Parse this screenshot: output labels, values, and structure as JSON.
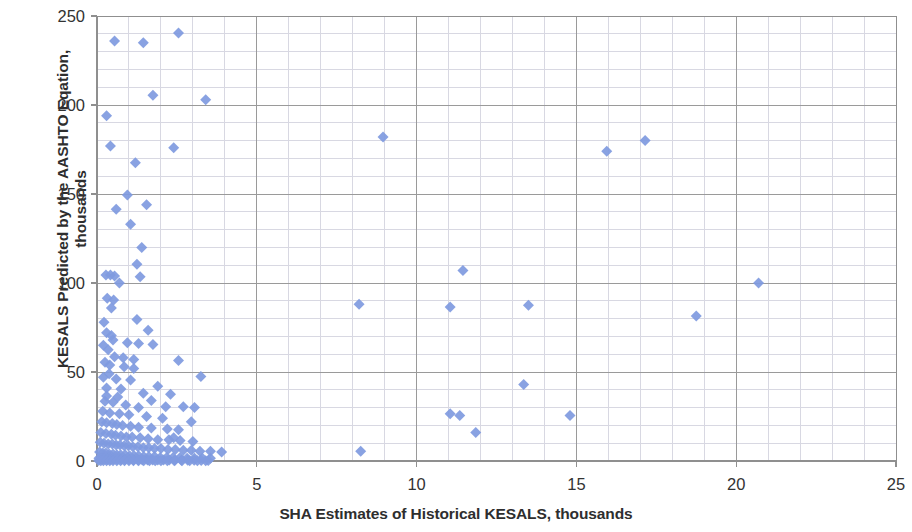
{
  "chart_data": {
    "type": "scatter",
    "title": "",
    "xlabel": "SHA Estimates of Historical KESALS, thousands",
    "ylabel": "KESALS Predicted by the AASHTO Eqation, thousands",
    "ylabel_line1": "KESALS Predicted by the AASHTO Eqation,",
    "ylabel_line2": "thousands",
    "xlim": [
      0,
      25
    ],
    "ylim": [
      0,
      250
    ],
    "xticks": [
      0,
      5,
      10,
      15,
      20,
      25
    ],
    "yticks": [
      0,
      50,
      100,
      150,
      200,
      250
    ],
    "xtick_labels": [
      "0",
      "5",
      "10",
      "15",
      "20",
      "25"
    ],
    "ytick_labels": [
      "0",
      "50",
      "100",
      "150",
      "200",
      "250"
    ],
    "x_minor_step": 1,
    "y_minor_step": 10,
    "grid": true,
    "grid_major_color": "#9a9a9a",
    "grid_minor_color": "#d8d8e2",
    "legend": false,
    "legend_position": "none",
    "series": [
      {
        "name": "KESALS",
        "marker": "diamond",
        "marker_color": "#7f9adf",
        "marker_size": 11,
        "points": [
          [
            0.3,
            194.0
          ],
          [
            0.55,
            236.0
          ],
          [
            1.45,
            235.0
          ],
          [
            2.55,
            240.5
          ],
          [
            0.42,
            177.0
          ],
          [
            1.2,
            167.5
          ],
          [
            1.75,
            205.5
          ],
          [
            2.4,
            176.0
          ],
          [
            3.4,
            203.0
          ],
          [
            8.95,
            182.0
          ],
          [
            15.95,
            174.0
          ],
          [
            17.15,
            180.0
          ],
          [
            0.6,
            141.5
          ],
          [
            0.95,
            149.5
          ],
          [
            1.05,
            133.0
          ],
          [
            1.55,
            144.0
          ],
          [
            1.25,
            110.5
          ],
          [
            11.45,
            107.0
          ],
          [
            0.28,
            104.5
          ],
          [
            0.42,
            104.5
          ],
          [
            0.55,
            104.0
          ],
          [
            1.35,
            103.5
          ],
          [
            20.7,
            100.0
          ],
          [
            0.32,
            91.5
          ],
          [
            0.52,
            90.5
          ],
          [
            8.2,
            88.0
          ],
          [
            11.05,
            86.5
          ],
          [
            13.5,
            87.5
          ],
          [
            18.75,
            81.5
          ],
          [
            0.22,
            78.0
          ],
          [
            0.3,
            72.0
          ],
          [
            0.45,
            70.5
          ],
          [
            1.25,
            79.5
          ],
          [
            1.6,
            73.5
          ],
          [
            0.2,
            65.0
          ],
          [
            0.35,
            62.5
          ],
          [
            0.95,
            66.5
          ],
          [
            1.3,
            66.0
          ],
          [
            1.75,
            65.5
          ],
          [
            0.55,
            58.5
          ],
          [
            0.25,
            55.5
          ],
          [
            0.4,
            54.0
          ],
          [
            0.85,
            53.0
          ],
          [
            1.15,
            52.0
          ],
          [
            2.55,
            56.5
          ],
          [
            13.35,
            43.0
          ],
          [
            0.2,
            47.0
          ],
          [
            0.6,
            46.0
          ],
          [
            1.05,
            45.5
          ],
          [
            3.25,
            47.5
          ],
          [
            0.3,
            41.0
          ],
          [
            0.75,
            40.5
          ],
          [
            1.45,
            38.0
          ],
          [
            2.3,
            37.5
          ],
          [
            0.25,
            33.5
          ],
          [
            0.5,
            33.0
          ],
          [
            0.9,
            31.5
          ],
          [
            1.3,
            30.0
          ],
          [
            2.7,
            30.5
          ],
          [
            3.05,
            30.0
          ],
          [
            11.05,
            26.5
          ],
          [
            11.35,
            25.5
          ],
          [
            14.8,
            25.5
          ],
          [
            0.18,
            28.0
          ],
          [
            0.4,
            27.0
          ],
          [
            0.7,
            26.5
          ],
          [
            1.0,
            26.0
          ],
          [
            1.55,
            25.0
          ],
          [
            2.05,
            24.0
          ],
          [
            11.85,
            16.0
          ],
          [
            0.15,
            22.0
          ],
          [
            0.3,
            21.5
          ],
          [
            0.48,
            21.0
          ],
          [
            0.62,
            20.5
          ],
          [
            0.8,
            20.0
          ],
          [
            1.05,
            19.5
          ],
          [
            1.3,
            19.0
          ],
          [
            1.7,
            18.5
          ],
          [
            2.2,
            18.0
          ],
          [
            2.55,
            17.5
          ],
          [
            0.12,
            16.0
          ],
          [
            0.28,
            15.5
          ],
          [
            0.45,
            15.0
          ],
          [
            0.58,
            14.5
          ],
          [
            0.75,
            14.0
          ],
          [
            0.92,
            13.5
          ],
          [
            1.1,
            13.5
          ],
          [
            1.35,
            13.0
          ],
          [
            1.6,
            12.5
          ],
          [
            1.9,
            12.0
          ],
          [
            2.25,
            12.0
          ],
          [
            2.6,
            11.5
          ],
          [
            3.0,
            11.0
          ],
          [
            8.25,
            5.5
          ],
          [
            0.1,
            10.5
          ],
          [
            0.22,
            10.0
          ],
          [
            0.35,
            9.5
          ],
          [
            0.48,
            9.5
          ],
          [
            0.6,
            9.0
          ],
          [
            0.72,
            9.0
          ],
          [
            0.85,
            8.5
          ],
          [
            0.98,
            8.5
          ],
          [
            1.12,
            8.0
          ],
          [
            1.28,
            8.0
          ],
          [
            1.45,
            7.5
          ],
          [
            1.62,
            7.5
          ],
          [
            1.8,
            7.0
          ],
          [
            2.0,
            7.0
          ],
          [
            2.22,
            6.5
          ],
          [
            2.45,
            6.5
          ],
          [
            2.7,
            6.0
          ],
          [
            2.95,
            6.0
          ],
          [
            3.22,
            5.5
          ],
          [
            3.55,
            5.5
          ],
          [
            3.9,
            5.0
          ],
          [
            0.08,
            5.0
          ],
          [
            0.18,
            4.5
          ],
          [
            0.28,
            4.5
          ],
          [
            0.38,
            4.0
          ],
          [
            0.5,
            4.0
          ],
          [
            0.62,
            3.5
          ],
          [
            0.74,
            3.5
          ],
          [
            0.88,
            3.5
          ],
          [
            1.02,
            3.0
          ],
          [
            1.16,
            3.0
          ],
          [
            1.3,
            3.0
          ],
          [
            1.46,
            2.5
          ],
          [
            1.62,
            2.5
          ],
          [
            1.8,
            2.5
          ],
          [
            1.98,
            2.0
          ],
          [
            2.18,
            2.0
          ],
          [
            2.38,
            2.0
          ],
          [
            2.6,
            2.0
          ],
          [
            2.82,
            1.5
          ],
          [
            3.05,
            1.5
          ],
          [
            3.3,
            1.5
          ],
          [
            3.55,
            1.5
          ],
          [
            0.06,
            1.5
          ],
          [
            0.14,
            1.2
          ],
          [
            0.22,
            1.2
          ],
          [
            0.32,
            1.0
          ],
          [
            0.42,
            1.0
          ],
          [
            0.52,
            1.0
          ],
          [
            0.64,
            0.8
          ],
          [
            0.76,
            0.8
          ],
          [
            0.88,
            0.8
          ],
          [
            1.0,
            0.8
          ],
          [
            1.14,
            0.6
          ],
          [
            1.28,
            0.6
          ],
          [
            1.42,
            0.6
          ],
          [
            1.58,
            0.6
          ],
          [
            1.74,
            0.5
          ],
          [
            1.9,
            0.5
          ],
          [
            2.08,
            0.5
          ],
          [
            2.26,
            0.5
          ],
          [
            2.44,
            0.4
          ],
          [
            2.64,
            0.4
          ],
          [
            2.84,
            0.4
          ],
          [
            3.04,
            0.4
          ],
          [
            3.26,
            0.3
          ],
          [
            3.48,
            0.3
          ],
          [
            0.05,
            0.3
          ],
          [
            0.12,
            0.2
          ],
          [
            0.2,
            0.2
          ],
          [
            0.3,
            0.2
          ],
          [
            0.4,
            0.2
          ],
          [
            0.5,
            0.2
          ],
          [
            0.62,
            0.1
          ],
          [
            0.74,
            0.1
          ],
          [
            0.86,
            0.1
          ],
          [
            1.0,
            0.1
          ],
          [
            1.14,
            0.1
          ],
          [
            1.3,
            0.1
          ],
          [
            1.46,
            0.1
          ],
          [
            1.64,
            0.1
          ],
          [
            1.82,
            0.1
          ],
          [
            2.0,
            0.1
          ],
          [
            2.2,
            0.1
          ],
          [
            2.42,
            0.1
          ],
          [
            2.66,
            0.1
          ],
          [
            2.9,
            0.1
          ],
          [
            3.14,
            0.1
          ],
          [
            3.4,
            0.1
          ],
          [
            0.7,
            100.0
          ],
          [
            0.45,
            86.0
          ],
          [
            1.4,
            120.0
          ],
          [
            0.38,
            49.0
          ],
          [
            0.65,
            36.0
          ],
          [
            2.15,
            30.5
          ],
          [
            0.82,
            58.0
          ],
          [
            1.9,
            42.0
          ],
          [
            0.5,
            68.0
          ],
          [
            2.95,
            22.0
          ],
          [
            1.15,
            57.0
          ],
          [
            0.3,
            36.5
          ],
          [
            2.4,
            13.0
          ],
          [
            1.7,
            34.0
          ]
        ]
      }
    ]
  },
  "axes": {
    "plot_left": 97,
    "plot_top": 16,
    "plot_right": 896,
    "plot_bottom": 461
  }
}
